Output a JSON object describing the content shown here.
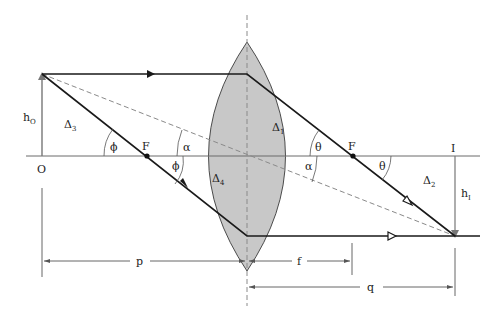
{
  "figure": {
    "type": "thin converging lens ray diagram",
    "colors": {
      "lens_fill": "#c8c8c8",
      "lens_stroke": "#3a3a3a",
      "ray": "#1a1a1a",
      "axis": "#6b6b6b",
      "dashed": "#8a8a8a"
    }
  },
  "labels": {
    "object_point": "O",
    "image_point": "I",
    "object_height": "h",
    "object_height_sub": "O",
    "image_height": "h",
    "image_height_sub": "I",
    "focal_left": "F",
    "focal_right": "F",
    "triangle_1": "Δ",
    "triangle_1_sub": "1",
    "triangle_2": "Δ",
    "triangle_2_sub": "2",
    "triangle_3": "Δ",
    "triangle_3_sub": "3",
    "triangle_4": "Δ",
    "triangle_4_sub": "4",
    "angle_phi_left": "ϕ",
    "angle_phi_right": "ϕ",
    "angle_alpha_left": "α",
    "angle_alpha_right": "α",
    "angle_theta_left": "θ",
    "angle_theta_right": "θ"
  },
  "dimensions": {
    "object_distance": "p",
    "focal_length": "f",
    "image_distance": "q"
  }
}
